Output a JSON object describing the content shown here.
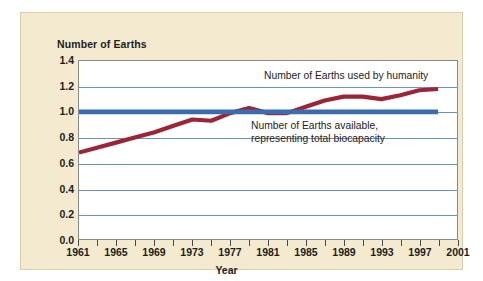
{
  "chart_data": {
    "type": "line",
    "title": "",
    "xlabel": "Year",
    "ylabel": "Number of Earths",
    "xlim": [
      1961,
      2001
    ],
    "ylim": [
      0.0,
      1.4
    ],
    "grid": true,
    "legend_position": "inline-annotations",
    "y_ticks": [
      "0.0",
      "0.2",
      "0.4",
      "0.6",
      "0.8",
      "1.0",
      "1.2",
      "1.4"
    ],
    "y_tick_values": [
      0.0,
      0.2,
      0.4,
      0.6,
      0.8,
      1.0,
      1.2,
      1.4
    ],
    "x_ticks": [
      "1961",
      "1965",
      "1969",
      "1973",
      "1977",
      "1981",
      "1985",
      "1989",
      "1993",
      "1997",
      "2001"
    ],
    "x_tick_values": [
      1961,
      1965,
      1969,
      1973,
      1977,
      1981,
      1985,
      1989,
      1993,
      1997,
      2001
    ],
    "x_minor_tick_values": [
      1961,
      1963,
      1965,
      1967,
      1969,
      1971,
      1973,
      1975,
      1977,
      1979,
      1981,
      1983,
      1985,
      1987,
      1989,
      1991,
      1993,
      1995,
      1997,
      1999,
      2001
    ],
    "annotations": [
      {
        "name": "footprint-annotation",
        "lines": [
          "Number of Earths used by humanity"
        ]
      },
      {
        "name": "biocapacity-annotation",
        "lines": [
          "Number of Earths available,",
          "representing total biocapacity"
        ]
      }
    ],
    "series": [
      {
        "name": "Number of Earths used by humanity",
        "color": "#9c2437",
        "x": [
          1961,
          1963,
          1965,
          1967,
          1969,
          1971,
          1973,
          1975,
          1977,
          1979,
          1981,
          1983,
          1985,
          1987,
          1989,
          1991,
          1993,
          1995,
          1997,
          1999
        ],
        "values": [
          0.68,
          0.72,
          0.76,
          0.8,
          0.84,
          0.89,
          0.94,
          0.93,
          0.99,
          1.03,
          0.99,
          0.99,
          1.04,
          1.09,
          1.12,
          1.12,
          1.1,
          1.13,
          1.17,
          1.18
        ]
      },
      {
        "name": "Number of Earths available, representing total biocapacity",
        "color": "#3a6cae",
        "x": [
          1961,
          1999
        ],
        "values": [
          1.0,
          1.0
        ]
      }
    ]
  },
  "panel": {
    "background_color": "#f3ead0",
    "plot_background_color": "#ffffff",
    "gridline_color": "#6f92c4",
    "frame_color": "#8a8a8a"
  }
}
